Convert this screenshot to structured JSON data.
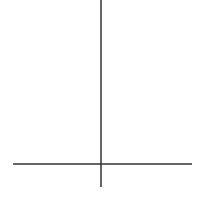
{
  "problem": {
    "number_label": "4)",
    "equation_label": "y = -5x + 29",
    "intercept_label": {
      "whole": "5",
      "numerator": "4",
      "denominator": "5"
    }
  },
  "chart_data": {
    "type": "line",
    "title": "",
    "xlabel": "",
    "ylabel": "",
    "equation": "y = -5x + 29",
    "slope": -5,
    "y_intercept": 29,
    "x_intercept": 5.8,
    "annotations": [
      "y = -5x + 29",
      "5 4/5"
    ],
    "grid": false,
    "color": "#222222"
  }
}
